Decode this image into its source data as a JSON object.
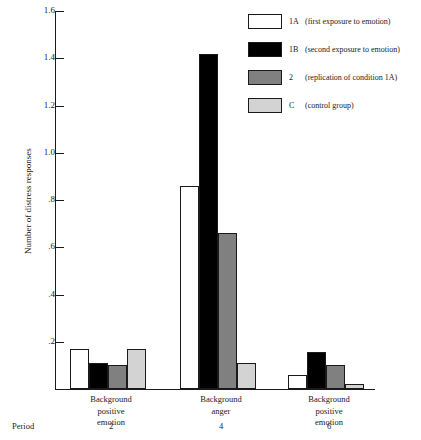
{
  "chart_data": {
    "type": "bar",
    "title": "",
    "xlabel": "",
    "ylabel": "Number of distress responses",
    "ylim": [
      0,
      1.6
    ],
    "ytick_labels": [
      "1.6",
      "1.4",
      "1.2",
      "1.0",
      ".8",
      ".6",
      ".4",
      ".2"
    ],
    "ytick_values": [
      1.6,
      1.4,
      1.2,
      1.0,
      0.8,
      0.6,
      0.4,
      0.2
    ],
    "grid": false,
    "legend_position": "top-right",
    "categories": [
      "Background positive emotion",
      "Background anger",
      "Background positive emotion"
    ],
    "category_lines": [
      [
        "Background",
        "positive",
        "emotion"
      ],
      [
        "Background",
        "anger"
      ],
      [
        "Background",
        "positive",
        "emotion"
      ]
    ],
    "period_label": "Period",
    "period_values": [
      "2",
      "4",
      "6"
    ],
    "series": [
      {
        "name": "1A",
        "description": "(first exposure to emotion)",
        "color": "#ffffff",
        "values": [
          0.17,
          0.86,
          0.06
        ]
      },
      {
        "name": "1B",
        "description": "(second exposure to emotion)",
        "color": "#000000",
        "values": [
          0.11,
          1.42,
          0.155
        ]
      },
      {
        "name": "2",
        "description": "(replication of condition 1A)",
        "color": "#808080",
        "values": [
          0.1,
          0.66,
          0.1
        ]
      },
      {
        "name": "C",
        "description": "(control group)",
        "color": "#d3d3d3",
        "values": [
          0.17,
          0.11,
          0.02
        ]
      }
    ]
  },
  "legend": {
    "items": [
      {
        "key": "1A",
        "desc": "(first exposure to emotion)",
        "color": "#ffffff"
      },
      {
        "key": "1B",
        "desc": "(second exposure to emotion)",
        "color": "#000000"
      },
      {
        "key": "2",
        "desc": "(replication of condition 1A)",
        "color": "#808080"
      },
      {
        "key": "C",
        "desc": "(control group)",
        "color": "#d3d3d3"
      }
    ]
  }
}
